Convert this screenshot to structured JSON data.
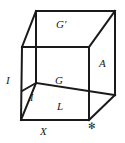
{
  "figure": {
    "type": "geometric-cube-diagram",
    "projection": "oblique",
    "stroke_color": "#1a1a1a",
    "background_color": "#ffffff",
    "labels": {
      "top_face": "G′",
      "right_face": "A",
      "left_edge": "I",
      "inner_vertex": "G",
      "inner_diagonal": "I",
      "front_face": "L",
      "bottom_edge": "X",
      "corner_mark": "✻"
    },
    "geometry": {
      "front_top_left": [
        22,
        47
      ],
      "front_top_right": [
        89,
        47
      ],
      "front_bottom_left": [
        21,
        120
      ],
      "front_bottom_right": [
        89,
        120
      ],
      "back_top_left": [
        36,
        11
      ],
      "back_top_right": [
        115,
        11
      ],
      "back_bottom_left": [
        36,
        83
      ],
      "back_bottom_right": [
        115,
        95
      ]
    }
  }
}
